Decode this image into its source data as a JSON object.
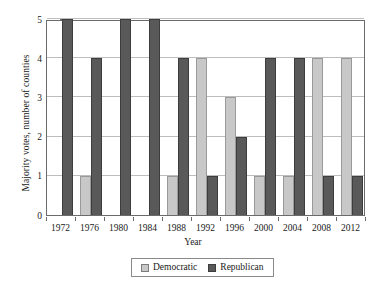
{
  "chart_data": {
    "type": "bar",
    "title": "",
    "xlabel": "Year",
    "ylabel": "Majority votes, number of counties",
    "categories": [
      "1972",
      "1976",
      "1980",
      "1984",
      "1988",
      "1992",
      "1996",
      "2000",
      "2004",
      "2008",
      "2012"
    ],
    "series": [
      {
        "name": "Democratic",
        "color": "#c8c8c8",
        "values": [
          0,
          1,
          0,
          0,
          1,
          4,
          3,
          1,
          1,
          4,
          4
        ]
      },
      {
        "name": "Republican",
        "color": "#595959",
        "values": [
          5,
          4,
          5,
          5,
          4,
          1,
          2,
          4,
          4,
          1,
          1
        ]
      }
    ],
    "ylim": [
      0,
      5
    ],
    "yticks": [
      0,
      1,
      2,
      3,
      4,
      5
    ],
    "ytick_labels": [
      "0",
      "1",
      "2",
      "3",
      "4",
      "5"
    ],
    "grid": true,
    "legend_position": "bottom"
  },
  "axes": {
    "y_title": "Majority votes, number of counties",
    "x_title": "Year"
  },
  "legend": {
    "entries": [
      {
        "label": "Democratic",
        "swatch": "democratic-swatch"
      },
      {
        "label": "Republican",
        "swatch": "republican-swatch"
      }
    ]
  }
}
